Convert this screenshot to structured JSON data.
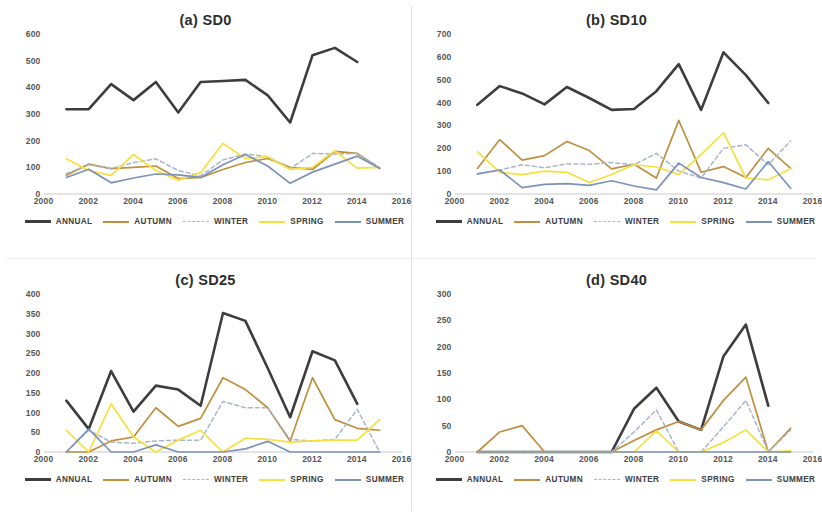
{
  "figure": {
    "panel_count": 4,
    "x_ticks": [
      "2000",
      "2002",
      "2004",
      "2006",
      "2008",
      "2010",
      "2012",
      "2014",
      "2016"
    ],
    "legend": [
      {
        "label": "ANNUAL",
        "color": "#3d3d3d",
        "style": "solid"
      },
      {
        "label": "AUTUMN",
        "color": "#bf8f3f",
        "style": "solid"
      },
      {
        "label": "WINTER",
        "color": "#a9b6c9",
        "style": "dashed"
      },
      {
        "label": "SPRING",
        "color": "#f5e03c",
        "style": "solid"
      },
      {
        "label": "SUMMER",
        "color": "#7b93b8",
        "style": "solid"
      }
    ]
  },
  "chart_data": [
    {
      "type": "line",
      "panel_id": "a",
      "title": "(a) SD0",
      "xlabel": "",
      "ylabel": "",
      "xlim": [
        2000,
        2016
      ],
      "ylim": [
        0,
        600
      ],
      "yticks": [
        0,
        100,
        200,
        300,
        400,
        500,
        600
      ],
      "xticks": [
        2000,
        2002,
        2004,
        2006,
        2008,
        2010,
        2012,
        2014,
        2016
      ],
      "grid": false,
      "legend_position": "bottom",
      "x": [
        2001,
        2002,
        2003,
        2004,
        2005,
        2006,
        2007,
        2008,
        2009,
        2010,
        2011,
        2012,
        2013,
        2014,
        2015
      ],
      "series": [
        {
          "name": "ANNUAL",
          "color": "#3d3d3d",
          "style": "solid",
          "values": [
            318,
            318,
            412,
            352,
            420,
            306,
            420,
            424,
            428,
            370,
            268,
            520,
            548,
            495,
            null
          ]
        },
        {
          "name": "AUTUMN",
          "color": "#bf8f3f",
          "style": "solid",
          "values": [
            70,
            112,
            95,
            100,
            105,
            58,
            62,
            92,
            118,
            133,
            100,
            92,
            160,
            152,
            95
          ]
        },
        {
          "name": "WINTER",
          "color": "#a9b6c9",
          "style": "dashed",
          "values": [
            76,
            110,
            95,
            118,
            132,
            88,
            68,
            128,
            150,
            140,
            95,
            152,
            150,
            152,
            100
          ]
        },
        {
          "name": "SPRING",
          "color": "#f5e03c",
          "style": "solid",
          "values": [
            132,
            88,
            70,
            148,
            88,
            52,
            80,
            190,
            133,
            140,
            92,
            100,
            162,
            97,
            100
          ]
        },
        {
          "name": "SUMMER",
          "color": "#7b93b8",
          "style": "solid",
          "values": [
            62,
            93,
            42,
            60,
            75,
            72,
            62,
            110,
            148,
            105,
            40,
            82,
            112,
            142,
            97
          ]
        }
      ]
    },
    {
      "type": "line",
      "panel_id": "b",
      "title": "(b) SD10",
      "xlabel": "",
      "ylabel": "",
      "xlim": [
        2000,
        2016
      ],
      "ylim": [
        0,
        700
      ],
      "yticks": [
        0,
        100,
        200,
        300,
        400,
        500,
        600,
        700
      ],
      "xticks": [
        2000,
        2002,
        2004,
        2006,
        2008,
        2010,
        2012,
        2014,
        2016
      ],
      "grid": false,
      "legend_position": "bottom",
      "x": [
        2001,
        2002,
        2003,
        2004,
        2005,
        2006,
        2007,
        2008,
        2009,
        2010,
        2011,
        2012,
        2013,
        2014,
        2015
      ],
      "series": [
        {
          "name": "ANNUAL",
          "color": "#3d3d3d",
          "style": "solid",
          "values": [
            390,
            472,
            440,
            392,
            468,
            420,
            368,
            372,
            450,
            568,
            368,
            620,
            520,
            398,
            null
          ]
        },
        {
          "name": "AUTUMN",
          "color": "#bf8f3f",
          "style": "solid",
          "values": [
            112,
            238,
            148,
            168,
            230,
            190,
            110,
            130,
            70,
            322,
            95,
            120,
            72,
            200,
            112
          ]
        },
        {
          "name": "WINTER",
          "color": "#a9b6c9",
          "style": "dashed",
          "values": [
            88,
            105,
            128,
            115,
            132,
            130,
            138,
            128,
            178,
            100,
            70,
            200,
            215,
            128,
            232
          ]
        },
        {
          "name": "SPRING",
          "color": "#f5e03c",
          "style": "solid",
          "values": [
            185,
            95,
            85,
            100,
            95,
            50,
            85,
            128,
            118,
            85,
            172,
            268,
            70,
            62,
            110
          ]
        },
        {
          "name": "SUMMER",
          "color": "#7b93b8",
          "style": "solid",
          "values": [
            88,
            105,
            28,
            42,
            45,
            38,
            58,
            35,
            18,
            135,
            72,
            50,
            22,
            142,
            25
          ]
        }
      ]
    },
    {
      "type": "line",
      "panel_id": "c",
      "title": "(c) SD25",
      "xlabel": "",
      "ylabel": "",
      "xlim": [
        2000,
        2016
      ],
      "ylim": [
        0,
        400
      ],
      "yticks": [
        0,
        50,
        100,
        150,
        200,
        250,
        300,
        350,
        400
      ],
      "xticks": [
        2000,
        2002,
        2004,
        2006,
        2008,
        2010,
        2012,
        2014,
        2016
      ],
      "grid": false,
      "legend_position": "bottom",
      "x": [
        2001,
        2002,
        2003,
        2004,
        2005,
        2006,
        2007,
        2008,
        2009,
        2010,
        2011,
        2012,
        2013,
        2014,
        2015
      ],
      "series": [
        {
          "name": "ANNUAL",
          "color": "#3d3d3d",
          "style": "solid",
          "values": [
            130,
            58,
            205,
            102,
            168,
            158,
            117,
            352,
            332,
            212,
            88,
            255,
            232,
            122,
            null
          ]
        },
        {
          "name": "AUTUMN",
          "color": "#bf8f3f",
          "style": "solid",
          "values": [
            0,
            0,
            28,
            38,
            112,
            65,
            85,
            188,
            158,
            112,
            28,
            188,
            82,
            60,
            55
          ]
        },
        {
          "name": "WINTER",
          "color": "#a9b6c9",
          "style": "dashed",
          "values": [
            0,
            55,
            25,
            22,
            28,
            30,
            30,
            128,
            112,
            112,
            32,
            28,
            32,
            108,
            0
          ]
        },
        {
          "name": "SPRING",
          "color": "#f5e03c",
          "style": "solid",
          "values": [
            55,
            0,
            122,
            38,
            0,
            30,
            55,
            0,
            35,
            32,
            25,
            28,
            30,
            30,
            82
          ]
        },
        {
          "name": "SUMMER",
          "color": "#7b93b8",
          "style": "solid",
          "values": [
            0,
            58,
            0,
            0,
            18,
            0,
            0,
            0,
            8,
            27,
            0,
            0,
            0,
            0,
            0
          ]
        }
      ]
    },
    {
      "type": "line",
      "panel_id": "d",
      "title": "(d) SD40",
      "xlabel": "",
      "ylabel": "",
      "xlim": [
        2000,
        2016
      ],
      "ylim": [
        0,
        300
      ],
      "yticks": [
        0,
        50,
        100,
        150,
        200,
        250,
        300
      ],
      "xticks": [
        2000,
        2002,
        2004,
        2006,
        2008,
        2010,
        2012,
        2014,
        2016
      ],
      "grid": false,
      "legend_position": "bottom",
      "x": [
        2001,
        2002,
        2003,
        2004,
        2005,
        2006,
        2007,
        2008,
        2009,
        2010,
        2011,
        2012,
        2013,
        2014,
        2015
      ],
      "series": [
        {
          "name": "ANNUAL",
          "color": "#3d3d3d",
          "style": "solid",
          "values": [
            0,
            0,
            0,
            0,
            0,
            0,
            0,
            82,
            122,
            58,
            42,
            182,
            242,
            88,
            null
          ]
        },
        {
          "name": "AUTUMN",
          "color": "#bf8f3f",
          "style": "solid",
          "values": [
            0,
            38,
            50,
            0,
            0,
            0,
            0,
            22,
            42,
            58,
            42,
            98,
            142,
            0,
            45
          ]
        },
        {
          "name": "WINTER",
          "color": "#a9b6c9",
          "style": "dashed",
          "values": [
            0,
            0,
            0,
            0,
            0,
            0,
            0,
            38,
            80,
            0,
            0,
            48,
            98,
            0,
            42
          ]
        },
        {
          "name": "SPRING",
          "color": "#f5e03c",
          "style": "solid",
          "values": [
            0,
            0,
            0,
            0,
            0,
            0,
            0,
            0,
            40,
            0,
            0,
            18,
            42,
            0,
            2
          ]
        },
        {
          "name": "SUMMER",
          "color": "#7b93b8",
          "style": "solid",
          "values": [
            0,
            0,
            0,
            0,
            0,
            0,
            0,
            0,
            0,
            0,
            0,
            0,
            0,
            0,
            0
          ]
        }
      ]
    }
  ]
}
